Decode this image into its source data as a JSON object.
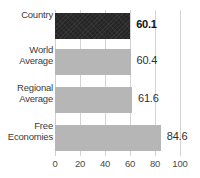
{
  "chart_data": {
    "type": "bar",
    "orientation": "horizontal",
    "title": "",
    "subtitle": "",
    "xlabel": "",
    "ylabel": "",
    "categories": [
      "Country",
      "World Average",
      "Regional Average",
      "Free Economies"
    ],
    "values": [
      60.1,
      60.4,
      61.6,
      84.6
    ],
    "value_labels": [
      "60.1",
      "60.4",
      "61.6",
      "84.6"
    ],
    "highlight_index": 0,
    "xlim": [
      0,
      100
    ],
    "xticks": [
      0,
      20,
      40,
      60,
      80,
      100
    ],
    "xtick_labels": [
      "0",
      "20",
      "40",
      "60",
      "80",
      "100"
    ],
    "grid": true,
    "grid_axis": "x",
    "legend": false,
    "legend_position": "none",
    "series": [
      {
        "name": "Score",
        "values": [
          60.1,
          60.4,
          61.6,
          84.6
        ]
      }
    ],
    "colors": {
      "highlight_bar": "#262626",
      "bar": "#b6b6b6",
      "gridline": "#d3d3d3",
      "text": "#3a3a3a",
      "background": "#ffffff"
    }
  },
  "axis": {
    "ticks": [
      {
        "label": "0",
        "value": 0
      },
      {
        "label": "20",
        "value": 20
      },
      {
        "label": "40",
        "value": 40
      },
      {
        "label": "60",
        "value": 60
      },
      {
        "label": "80",
        "value": 80
      },
      {
        "label": "100",
        "value": 100
      }
    ]
  },
  "rows": [
    {
      "category": "Country",
      "category_line1": "Country",
      "category_line2": "",
      "value": 60.1,
      "value_label": "60.1",
      "style": "dark",
      "emphasis": true
    },
    {
      "category": "World Average",
      "category_line1": "World",
      "category_line2": "Average",
      "value": 60.4,
      "value_label": "60.4",
      "style": "gray",
      "emphasis": false
    },
    {
      "category": "Regional Average",
      "category_line1": "Regional",
      "category_line2": "Average",
      "value": 61.6,
      "value_label": "61.6",
      "style": "gray",
      "emphasis": false
    },
    {
      "category": "Free Economies",
      "category_line1": "Free",
      "category_line2": "Economies",
      "value": 84.6,
      "value_label": "84.6",
      "style": "gray",
      "emphasis": false
    }
  ]
}
